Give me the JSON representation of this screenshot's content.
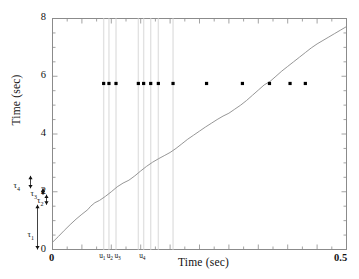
{
  "chart_data": {
    "type": "line",
    "title": "",
    "xlabel": "Time (sec)",
    "ylabel": "Time (sec)",
    "xlim": [
      0,
      0.5
    ],
    "ylim": [
      0,
      8
    ],
    "xticks": [
      0,
      0.5
    ],
    "xticklabels": [
      "0",
      "0.5"
    ],
    "yticks": [
      0,
      2,
      4,
      6,
      8
    ],
    "yticklabels": [
      "0",
      "2",
      "4",
      "6",
      "8"
    ],
    "grid": false,
    "legend": null,
    "series": [
      {
        "name": "cumulative-time-curve",
        "type": "line",
        "color": "#8a8a8a",
        "x": [
          0.0,
          0.01,
          0.02,
          0.03,
          0.04,
          0.05,
          0.06,
          0.065,
          0.072,
          0.08,
          0.09,
          0.1,
          0.11,
          0.12,
          0.13,
          0.14,
          0.15,
          0.16,
          0.17,
          0.18,
          0.19,
          0.2,
          0.21,
          0.22,
          0.23,
          0.24,
          0.25,
          0.26,
          0.27,
          0.28,
          0.29,
          0.3,
          0.31,
          0.32,
          0.33,
          0.34,
          0.35,
          0.36,
          0.37,
          0.38,
          0.39,
          0.4,
          0.41,
          0.42,
          0.43,
          0.44,
          0.45,
          0.46,
          0.47,
          0.48,
          0.49,
          0.5
        ],
        "y": [
          0.25,
          0.45,
          0.66,
          0.86,
          1.05,
          1.22,
          1.38,
          1.5,
          1.62,
          1.7,
          1.84,
          2.0,
          2.17,
          2.3,
          2.4,
          2.55,
          2.72,
          2.88,
          3.02,
          3.14,
          3.25,
          3.36,
          3.5,
          3.66,
          3.82,
          3.96,
          4.1,
          4.24,
          4.37,
          4.5,
          4.62,
          4.72,
          4.86,
          5.0,
          5.16,
          5.34,
          5.52,
          5.7,
          5.82,
          6.0,
          6.18,
          6.34,
          6.5,
          6.66,
          6.82,
          6.98,
          7.12,
          7.24,
          7.36,
          7.48,
          7.6,
          7.72
        ]
      },
      {
        "name": "event-markers",
        "type": "scatter",
        "color": "#000000",
        "marker": "square",
        "y_value": 5.75,
        "x": [
          0.087,
          0.096,
          0.108,
          0.146,
          0.155,
          0.167,
          0.18,
          0.205,
          0.262,
          0.323,
          0.369,
          0.404,
          0.43
        ]
      }
    ],
    "vertical_guides": {
      "color": "#e2e2e2",
      "x": [
        0.087,
        0.096,
        0.108,
        0.146,
        0.155,
        0.167,
        0.18,
        0.205
      ]
    },
    "x_annotations": [
      {
        "label": "u",
        "sub": "1",
        "x": 0.087
      },
      {
        "label": "u",
        "sub": "2",
        "x": 0.1
      },
      {
        "label": "u",
        "sub": "3",
        "x": 0.113
      },
      {
        "label": "u",
        "sub": "4",
        "x": 0.155
      }
    ],
    "y_annotations": [
      {
        "label": "τ",
        "sub": "1",
        "from": 0.0,
        "to": 1.55
      },
      {
        "label": "τ",
        "sub": "2",
        "from": 1.55,
        "to": 1.9
      },
      {
        "label": "τ",
        "sub": "3",
        "from": 1.9,
        "to": 2.12
      },
      {
        "label": "τ",
        "sub": "4",
        "from": 2.12,
        "to": 2.55
      }
    ]
  },
  "axes": {
    "ylabel_text": "Time (sec)",
    "xlabel_text": "Time (sec)",
    "ytick_0": "0",
    "ytick_2": "2",
    "ytick_4": "4",
    "ytick_6": "6",
    "ytick_8": "8",
    "xtick_min": "0",
    "xtick_max": "0.5"
  },
  "annotations": {
    "u1": "u",
    "u1_sub": "1",
    "u2": "u",
    "u2_sub": "2",
    "u3": "u",
    "u3_sub": "3",
    "u4": "u",
    "u4_sub": "4",
    "t1": "τ",
    "t1_sub": "1",
    "t2": "τ",
    "t2_sub": "2",
    "t3": "τ",
    "t3_sub": "3",
    "t4": "τ",
    "t4_sub": "4"
  },
  "colors": {
    "curve": "#8a8a8a",
    "marker": "#000000",
    "axis": "#8b8b8b",
    "guide": "#e2e2e2",
    "text": "#111111"
  }
}
